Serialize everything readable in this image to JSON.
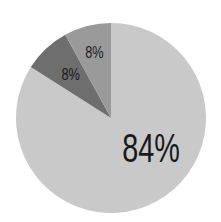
{
  "chart_data": {
    "type": "pie",
    "title": "",
    "categories": [
      "A",
      "B",
      "C"
    ],
    "values": [
      84,
      8,
      8
    ],
    "labels": [
      "84%",
      "8%",
      "8%"
    ],
    "colors": [
      "#c9c9c9",
      "#6e6e6e",
      "#9a9a9a"
    ],
    "start_angle_deg": 90,
    "direction": "clockwise-from-top: 84% slice first, then dark 8%, then mid 8%",
    "legend": null
  }
}
